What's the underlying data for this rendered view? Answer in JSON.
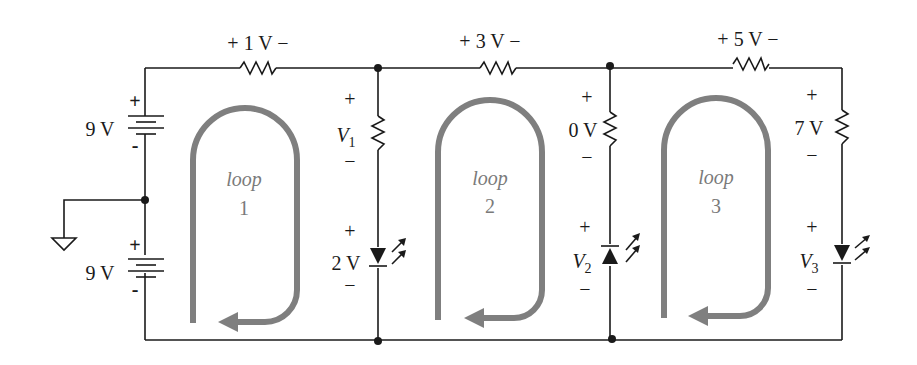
{
  "diagram": {
    "type": "circuit",
    "colors": {
      "wire": "#1a1a1a",
      "loop_arrow": "#7f7f7f",
      "loop_label": "#7a7a7a"
    },
    "sources": [
      {
        "id": "battery-top",
        "label": "9 V",
        "plus": "+",
        "minus": "-"
      },
      {
        "id": "battery-bottom",
        "label": "9 V",
        "plus": "+",
        "minus": "-"
      }
    ],
    "top_resistors": [
      {
        "id": "r-top-1",
        "label": "+ 1 V −"
      },
      {
        "id": "r-top-2",
        "label": "+ 3 V −"
      },
      {
        "id": "r-top-3",
        "label": "+ 5 V −"
      }
    ],
    "branch_1": {
      "resistor": {
        "plus": "+",
        "var": "V",
        "sub": "1",
        "minus": "−"
      },
      "led": {
        "plus": "+",
        "label": "2 V",
        "minus": "−",
        "orientation": "down"
      }
    },
    "branch_2": {
      "resistor": {
        "plus": "+",
        "label": "0 V",
        "minus": "−"
      },
      "led": {
        "plus": "+",
        "var": "V",
        "sub": "2",
        "minus": "−",
        "orientation": "up"
      }
    },
    "branch_3": {
      "resistor": {
        "plus": "+",
        "label": "7 V",
        "minus": "−"
      },
      "led": {
        "plus": "+",
        "var": "V",
        "sub": "3",
        "minus": "−",
        "orientation": "down"
      }
    },
    "loops": [
      {
        "word": "loop",
        "number": "1"
      },
      {
        "word": "loop",
        "number": "2"
      },
      {
        "word": "loop",
        "number": "3"
      }
    ],
    "ground": {
      "symbol": "ground"
    }
  }
}
